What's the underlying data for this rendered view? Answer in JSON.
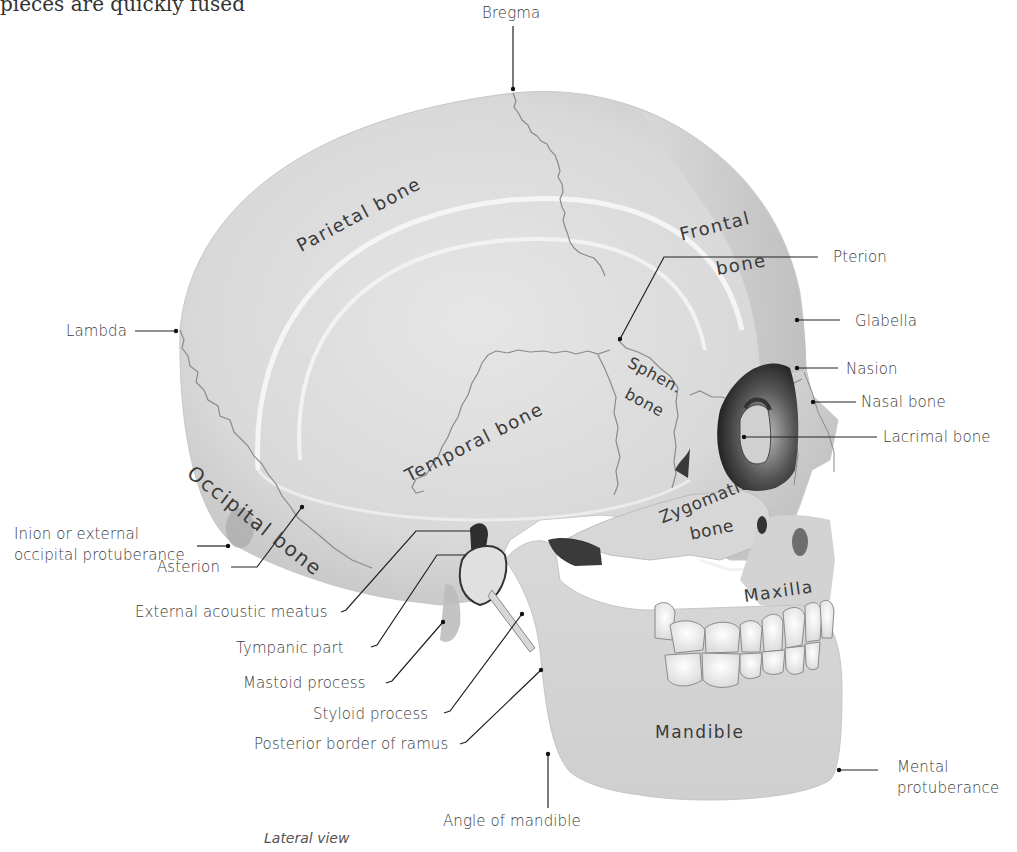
{
  "figure": {
    "caption": "Lateral view",
    "top_cutoff_text": "pieces are quickly fused"
  },
  "bone_labels": {
    "parietal": "Parietal bone",
    "frontal_line1": "Frontal",
    "frontal_line2": "bone",
    "temporal": "Temporal bone",
    "occipital": "Occipital bone",
    "sphenoid_line1": "Sphen.",
    "sphenoid_line2": "bone",
    "zygomatic_line1": "Zygomatic",
    "zygomatic_line2": "bone",
    "maxilla": "Maxilla",
    "mandible": "Mandible"
  },
  "callouts": {
    "bregma": "Bregma",
    "pterion": "Pterion",
    "glabella": "Glabella",
    "nasion": "Nasion",
    "nasal_bone": "Nasal bone",
    "lacrimal_bone": "Lacrimal bone",
    "lambda": "Lambda",
    "inion": "Inion or external\noccipital protuberance",
    "asterion": "Asterion",
    "external_acoustic_meatus": "External acoustic meatus",
    "tympanic_part": "Tympanic part",
    "mastoid_process": "Mastoid process",
    "styloid_process": "Styloid process",
    "posterior_border_ramus": "Posterior border of ramus",
    "angle_of_mandible": "Angle of mandible",
    "mental_protuberance": "Mental\nprotuberance"
  },
  "colors": {
    "bone": "#dcdcdc",
    "bone_light": "#ececec",
    "bone_shadow": "#b8b8b8",
    "dark_cavity": "#3a3a3a",
    "suture": "#8a8a8a",
    "leader": "#222222",
    "text": "#3c3c3c"
  }
}
